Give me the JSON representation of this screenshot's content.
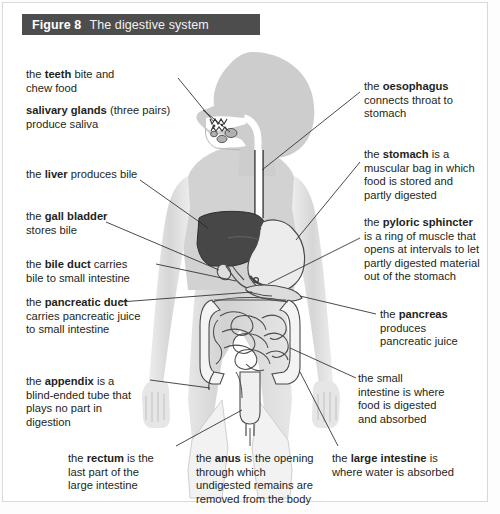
{
  "figure": {
    "number": "Figure 8",
    "title": "The digestive system",
    "header_bg": "#4d4d4d",
    "header_text_color": "#ffffff"
  },
  "colors": {
    "body_fill": "#cfcfcf",
    "body_light": "#e4e4e4",
    "liver_fill": "#4a4a4a",
    "stomach_fill": "#e8e8e8",
    "outline": "#4a4a4a",
    "leader_line": "#2b2b2b",
    "page_bg": "#ffffff",
    "text": "#231f20"
  },
  "labels": {
    "teeth": {
      "id": "teeth",
      "text": "the teeth bite and\nchew food",
      "bold_term": "teeth",
      "side": "left"
    },
    "salivary_glands": {
      "id": "salivary-glands",
      "text": "salivary glands (three pairs)\nproduce saliva",
      "bold_term": "salivary glands",
      "side": "left"
    },
    "liver": {
      "id": "liver",
      "text": "the liver produces bile",
      "bold_term": "liver",
      "side": "left"
    },
    "gall_bladder": {
      "id": "gall-bladder",
      "text": "the gall bladder\nstores bile",
      "bold_term": "gall bladder",
      "side": "left"
    },
    "bile_duct": {
      "id": "bile-duct",
      "text": "the bile duct carries\nbile to small intestine",
      "bold_term": "bile duct",
      "side": "left"
    },
    "pancreatic_duct": {
      "id": "pancreatic-duct",
      "text": "the pancreatic duct\ncarries pancreatic juice\nto small intestine",
      "bold_term": "pancreatic duct",
      "side": "left"
    },
    "appendix": {
      "id": "appendix",
      "text": "the appendix is a\nblind-ended tube that\nplays no part in\ndigestion",
      "bold_term": "appendix",
      "side": "left"
    },
    "oesophagus": {
      "id": "oesophagus",
      "text": "the oesophagus\nconnects throat to\nstomach",
      "bold_term": "oesophagus",
      "side": "right"
    },
    "stomach": {
      "id": "stomach",
      "text": "the stomach is a\nmuscular bag in which\nfood is stored and\npartly digested",
      "bold_term": "stomach",
      "side": "right"
    },
    "pyloric_sphincter": {
      "id": "pyloric-sphincter",
      "text": "the pyloric sphincter\nis a ring of muscle that\nopens at intervals to let\npartly digested material\nout of the stomach",
      "bold_term": "pyloric sphincter",
      "side": "right"
    },
    "pancreas": {
      "id": "pancreas",
      "text": "the pancreas\nproduces\npancreatic juice",
      "bold_term": "pancreas",
      "side": "right"
    },
    "small_intestine": {
      "id": "small-intestine",
      "text": "the small\nintestine is where\nfood is digested\nand absorbed",
      "bold_term": "small intestine",
      "side": "right"
    },
    "rectum": {
      "id": "rectum",
      "text": "the rectum is the\nlast part of the\nlarge intestine",
      "bold_term": "rectum",
      "side": "bottom"
    },
    "anus": {
      "id": "anus",
      "text": "the anus is the opening\nthrough which\nundigested remains are\nremoved from the body",
      "bold_term": "anus",
      "side": "bottom"
    },
    "large_intestine": {
      "id": "large-intestine",
      "text": "the large intestine is\nwhere water is absorbed",
      "bold_term": "large intestine",
      "side": "bottom"
    }
  },
  "organs": [
    "head",
    "mouth",
    "teeth",
    "salivary-glands",
    "oesophagus",
    "stomach",
    "pyloric-sphincter",
    "liver",
    "gall-bladder",
    "bile-duct",
    "pancreas",
    "pancreatic-duct",
    "small-intestine",
    "large-intestine",
    "appendix",
    "rectum",
    "anus"
  ]
}
